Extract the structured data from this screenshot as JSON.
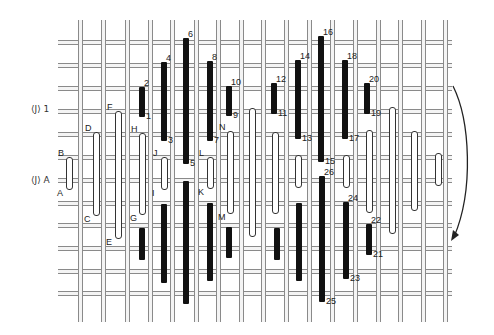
{
  "diagram": {
    "type": "weave-stitch-diagram",
    "side_labels": [
      {
        "id": "row1",
        "text": "⟨J⟩ 1",
        "x": 31,
        "y": 110
      },
      {
        "id": "rowA",
        "text": "⟨J⟩ A",
        "x": 31,
        "y": 181
      }
    ],
    "grid": {
      "h_lines_y": [
        42,
        65,
        88,
        111,
        134,
        157,
        180,
        203,
        225,
        248,
        271,
        293
      ],
      "h_x_start": 58,
      "h_x_end": 452,
      "v_lines_x": [
        80,
        103,
        127,
        150,
        172,
        196,
        218,
        241,
        263,
        286,
        309,
        332,
        355,
        378,
        400,
        423,
        445
      ],
      "v_y_start": 20,
      "v_y_end": 322
    },
    "black_bars_upper": [
      {
        "x": 139,
        "y1": 87,
        "y2": 117,
        "top_label": "2",
        "bottom_label": "1"
      },
      {
        "x": 161,
        "y1": 62,
        "y2": 141,
        "top_label": "4",
        "bottom_label": "3"
      },
      {
        "x": 183,
        "y1": 38,
        "y2": 164,
        "top_label": "6",
        "bottom_label": "5"
      },
      {
        "x": 207,
        "y1": 61,
        "y2": 141,
        "top_label": "8",
        "bottom_label": "7"
      },
      {
        "x": 226,
        "y1": 86,
        "y2": 116,
        "top_label": "10",
        "bottom_label": "9"
      },
      {
        "x": 271,
        "y1": 83,
        "y2": 114,
        "top_label": "12",
        "bottom_label": "11"
      },
      {
        "x": 295,
        "y1": 60,
        "y2": 139,
        "top_label": "14",
        "bottom_label": "13"
      },
      {
        "x": 318,
        "y1": 36,
        "y2": 162,
        "top_label": "16",
        "bottom_label": "15"
      },
      {
        "x": 342,
        "y1": 60,
        "y2": 139,
        "top_label": "18",
        "bottom_label": "17"
      },
      {
        "x": 364,
        "y1": 83,
        "y2": 114,
        "top_label": "20",
        "bottom_label": "19"
      }
    ],
    "black_bars_lower": [
      {
        "x": 139,
        "y1": 228,
        "y2": 260,
        "top_label": "",
        "bottom_label": ""
      },
      {
        "x": 161,
        "y1": 204,
        "y2": 283,
        "top_label": "",
        "bottom_label": ""
      },
      {
        "x": 183,
        "y1": 181,
        "y2": 304,
        "top_label": "",
        "bottom_label": ""
      },
      {
        "x": 207,
        "y1": 203,
        "y2": 281,
        "top_label": "",
        "bottom_label": ""
      },
      {
        "x": 226,
        "y1": 227,
        "y2": 258,
        "top_label": "",
        "bottom_label": ""
      },
      {
        "x": 274,
        "y1": 228,
        "y2": 260,
        "top_label": "",
        "bottom_label": ""
      },
      {
        "x": 296,
        "y1": 203,
        "y2": 281,
        "top_label": "",
        "bottom_label": ""
      },
      {
        "x": 319,
        "y1": 176,
        "y2": 302,
        "top_label": "26",
        "bottom_label": "25"
      },
      {
        "x": 343,
        "y1": 202,
        "y2": 279,
        "top_label": "24",
        "bottom_label": "23"
      },
      {
        "x": 366,
        "y1": 224,
        "y2": 255,
        "top_label": "22",
        "bottom_label": "21"
      }
    ],
    "white_bars": [
      {
        "x": 66,
        "y1": 157,
        "y2": 188,
        "top_label": "B",
        "bottom_label": "A"
      },
      {
        "x": 93,
        "y1": 132,
        "y2": 214,
        "top_label": "D",
        "bottom_label": "C"
      },
      {
        "x": 115,
        "y1": 111,
        "y2": 237,
        "top_label": "F",
        "bottom_label": "E"
      },
      {
        "x": 139,
        "y1": 133,
        "y2": 213,
        "top_label": "H",
        "bottom_label": "G"
      },
      {
        "x": 161,
        "y1": 157,
        "y2": 188,
        "top_label": "J",
        "bottom_label": "I"
      },
      {
        "x": 207,
        "y1": 157,
        "y2": 187,
        "top_label": "L",
        "bottom_label": "K"
      },
      {
        "x": 227,
        "y1": 131,
        "y2": 212,
        "top_label": "N",
        "bottom_label": "M"
      },
      {
        "x": 249,
        "y1": 108,
        "y2": 235,
        "top_label": "",
        "bottom_label": ""
      },
      {
        "x": 272,
        "y1": 132,
        "y2": 212,
        "top_label": "",
        "bottom_label": ""
      },
      {
        "x": 295,
        "y1": 155,
        "y2": 186,
        "top_label": "",
        "bottom_label": ""
      },
      {
        "x": 343,
        "y1": 155,
        "y2": 186,
        "top_label": "",
        "bottom_label": ""
      },
      {
        "x": 366,
        "y1": 130,
        "y2": 211,
        "top_label": "",
        "bottom_label": ""
      },
      {
        "x": 389,
        "y1": 107,
        "y2": 232,
        "top_label": "",
        "bottom_label": ""
      },
      {
        "x": 411,
        "y1": 131,
        "y2": 209,
        "top_label": "",
        "bottom_label": ""
      },
      {
        "x": 435,
        "y1": 153,
        "y2": 184,
        "top_label": "",
        "bottom_label": ""
      }
    ],
    "arrow": {
      "direction": "clockwise-down",
      "from": [
        453,
        86
      ],
      "to": [
        452,
        237
      ]
    }
  }
}
